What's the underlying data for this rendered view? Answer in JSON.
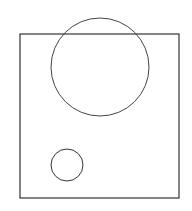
{
  "canvas": {
    "width": 192,
    "height": 211,
    "background": "#ffffff"
  },
  "shapes": {
    "rectangle": {
      "x": 20,
      "y": 34,
      "width": 159,
      "height": 164,
      "stroke": "#333333"
    },
    "large_circle": {
      "cx": 100,
      "cy": 67,
      "r": 49,
      "stroke": "#444444"
    },
    "small_circle": {
      "cx": 67,
      "cy": 165,
      "r": 16,
      "stroke": "#333333"
    }
  }
}
